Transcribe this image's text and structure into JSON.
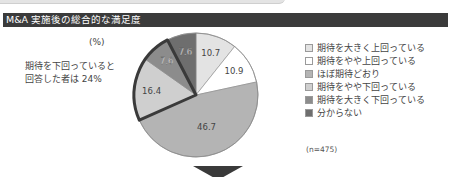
{
  "header": {
    "title": "M&A 実施後の総合的な満足度"
  },
  "chart_data": {
    "type": "pie",
    "title": "M&A 実施後の総合的な満足度",
    "unit": "(%)",
    "start_angle": "12 o'clock, clockwise",
    "categories": [
      "期待を大きく上回っている",
      "期待をやや上回っている",
      "ほぼ期待どおり",
      "期待をやや下回っている",
      "期待を大きく下回っている",
      "分からない"
    ],
    "values": [
      10.7,
      10.9,
      46.7,
      16.4,
      7.6,
      7.6
    ],
    "colors": [
      "#e3e3e3",
      "#ffffff",
      "#b4b4b4",
      "#cfcfcf",
      "#8c8c8c",
      "#6e6e6e"
    ],
    "highlight": {
      "slices": [
        3,
        4
      ],
      "border_color": "#3a3a3a",
      "label": "期待を下回っている と回答した者は 24%"
    },
    "legend_position": "right",
    "sample_size": "(n=475)"
  },
  "chart": {
    "unit": "(%)",
    "note_lines": [
      "期待を下回っていると",
      "回答した者は 24%"
    ],
    "labels": [
      "10.7",
      "10.9",
      "46.7",
      "16.4",
      "7.6",
      "7.6"
    ],
    "legend": [
      {
        "label": "期待を大きく上回っている",
        "color": "#e3e3e3"
      },
      {
        "label": "期待をやや上回っている",
        "color": "#ffffff"
      },
      {
        "label": "ほぼ期待どおり",
        "color": "#b4b4b4"
      },
      {
        "label": "期待をやや下回っている",
        "color": "#cfcfcf"
      },
      {
        "label": "期待を大きく下回っている",
        "color": "#8c8c8c"
      },
      {
        "label": "分からない",
        "color": "#6e6e6e"
      }
    ],
    "sample": "(n=475)"
  },
  "arrow": {
    "icon": "down-triangle-icon"
  }
}
